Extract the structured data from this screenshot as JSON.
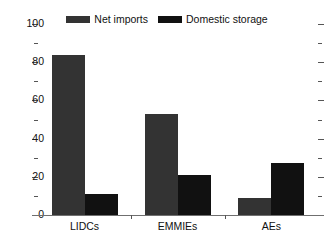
{
  "chart_data": {
    "type": "bar",
    "title": "",
    "subtitle": "",
    "xlabel": "",
    "ylabel": "",
    "categories": [
      "LIDCs",
      "EMMIEs",
      "AEs"
    ],
    "series": [
      {
        "name": "Net imports",
        "color": "#333333",
        "values": [
          84,
          53,
          9
        ]
      },
      {
        "name": "Domestic storage",
        "color": "#111111",
        "values": [
          11,
          21,
          27
        ]
      }
    ],
    "ylim": [
      0,
      100
    ],
    "ytick_labels": [
      "0",
      "20",
      "40",
      "60",
      "80",
      "100"
    ],
    "ytick_values": [
      0,
      20,
      40,
      60,
      80,
      100
    ],
    "yminor_values": [
      10,
      30,
      50,
      70,
      90
    ],
    "grid": false,
    "legend_position": "top-center",
    "axis_right_ticks": true
  },
  "legend": {
    "entries": [
      {
        "label": "Net imports",
        "swatch": "legend-swatch-net-imports"
      },
      {
        "label": "Domestic storage",
        "swatch": "legend-swatch-domestic-storage"
      }
    ]
  },
  "colors": {
    "series_net_imports": "#333333",
    "series_domestic_storage": "#111111",
    "axis": "#6f6f6f",
    "tick": "#555555",
    "text": "#111111",
    "background": "#ffffff"
  }
}
